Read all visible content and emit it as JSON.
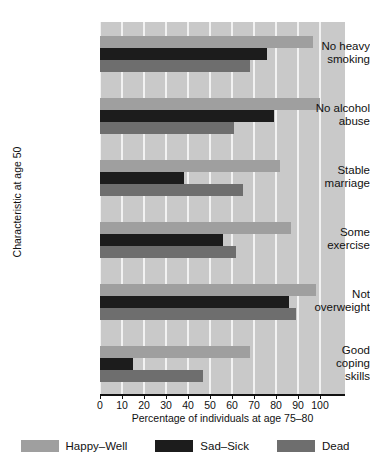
{
  "chart_data": {
    "type": "bar",
    "orientation": "horizontal",
    "title": "",
    "xlabel": "Percentage of individuals at age 75–80",
    "ylabel": "Characteristic at age 50",
    "xlim": [
      0,
      100
    ],
    "xticks": [
      0,
      10,
      20,
      30,
      40,
      50,
      60,
      70,
      80,
      90,
      100
    ],
    "xticklabels": [
      "0",
      "10",
      "20",
      "30",
      "40",
      "50",
      "60",
      "70",
      "80",
      "90",
      "100"
    ],
    "grid": "vertical-white",
    "legend_position": "bottom",
    "categories": [
      "No heavy smoking",
      "No alcohol abuse",
      "Stable marriage",
      "Some exercise",
      "Not overweight",
      "Good coping skills"
    ],
    "category_lines": [
      [
        "No heavy",
        "smoking"
      ],
      [
        "No alcohol",
        "abuse"
      ],
      [
        "Stable",
        "marriage"
      ],
      [
        "Some",
        "exercise"
      ],
      [
        "Not",
        "overweight"
      ],
      [
        "Good",
        "coping",
        "skills"
      ]
    ],
    "series": [
      {
        "name": "Happy–Well",
        "color": "#9f9f9f",
        "values": [
          97,
          100,
          82,
          87,
          98,
          68
        ]
      },
      {
        "name": "Sad–Sick",
        "color": "#1c1c1c",
        "values": [
          76,
          79,
          38,
          56,
          86,
          15
        ]
      },
      {
        "name": "Dead",
        "color": "#6e6e6e",
        "values": [
          68,
          61,
          65,
          62,
          89,
          47
        ]
      }
    ],
    "panel_background": "#c9c9c9",
    "gridline_color": "#f2f2f2"
  }
}
